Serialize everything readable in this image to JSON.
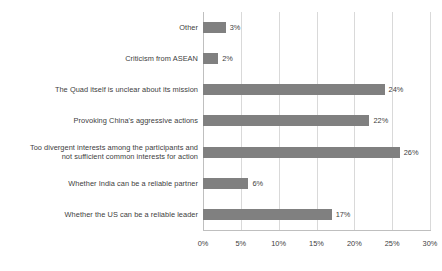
{
  "chart_data": {
    "type": "bar",
    "orientation": "horizontal",
    "title": "",
    "subtitle": "",
    "xlabel": "",
    "ylabel": "",
    "xlim": [
      0,
      30
    ],
    "grid": true,
    "legend": false,
    "value_suffix": "%",
    "bar_color": "#808080",
    "gridline_color": "#d9d9d9",
    "text_color": "#404040",
    "background": "#ffffff",
    "xticks": [
      {
        "value": 0,
        "label": "0%"
      },
      {
        "value": 5,
        "label": "5%"
      },
      {
        "value": 10,
        "label": "10%"
      },
      {
        "value": 15,
        "label": "15%"
      },
      {
        "value": 20,
        "label": "20%"
      },
      {
        "value": 25,
        "label": "25%"
      },
      {
        "value": 30,
        "label": "30%"
      }
    ],
    "categories": [
      "Other",
      "Criticism from ASEAN",
      "The Quad itself is unclear about its mission",
      "Provoking China's aggressive actions",
      "Too divergent interests among the participants and\nnot sufficient common interests for action",
      "Whether India can be a reliable partner",
      "Whether the US can be a reliable leader"
    ],
    "values": [
      3,
      2,
      24,
      22,
      26,
      6,
      17
    ],
    "data_labels": [
      "3%",
      "2%",
      "24%",
      "22%",
      "26%",
      "6%",
      "17%"
    ],
    "bars": [
      {
        "category": "Other",
        "value": 3,
        "label": "3%"
      },
      {
        "category": "Criticism from ASEAN",
        "value": 2,
        "label": "2%"
      },
      {
        "category": "The Quad itself is unclear about its mission",
        "value": 24,
        "label": "24%"
      },
      {
        "category": "Provoking China's aggressive actions",
        "value": 22,
        "label": "22%"
      },
      {
        "category": "Too divergent interests among the participants and\nnot sufficient common interests for action",
        "value": 26,
        "label": "26%"
      },
      {
        "category": "Whether India can be a reliable partner",
        "value": 6,
        "label": "6%"
      },
      {
        "category": "Whether the US can be a reliable leader",
        "value": 17,
        "label": "17%"
      }
    ]
  }
}
